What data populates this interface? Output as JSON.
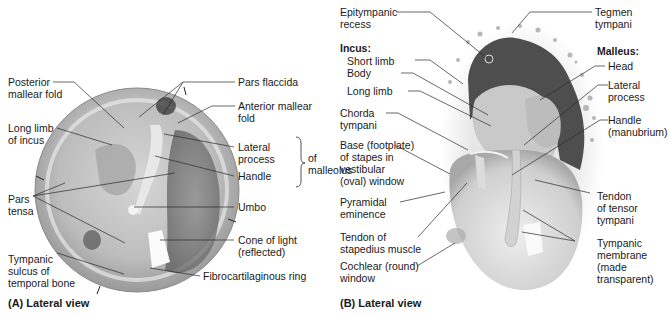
{
  "panel_a": {
    "caption": "(A) Lateral view",
    "labels": {
      "posterior_mallear_fold": [
        "Posterior",
        "mallear fold"
      ],
      "long_limb_incus": [
        "Long limb",
        "of incus"
      ],
      "pars_tensa": [
        "Pars",
        "tensa"
      ],
      "tympanic_sulcus": [
        "Tympanic",
        "sulcus of",
        "temporal bone"
      ],
      "pars_flaccida": "Pars flaccida",
      "anterior_mallear_fold": [
        "Anterior mallear",
        "fold"
      ],
      "lateral_process": [
        "Lateral",
        "process"
      ],
      "handle": "Handle",
      "of_malleolus": [
        "of",
        "malleolus"
      ],
      "umbo": "Umbo",
      "cone_of_light": [
        "Cone of light",
        "(reflected)"
      ],
      "fibrocartilaginous_ring": "Fibrocartilaginous ring"
    }
  },
  "panel_b": {
    "caption": "(B) Lateral view",
    "labels": {
      "epitympanic_recess": [
        "Epitympanic",
        "recess"
      ],
      "incus_heading": "Incus:",
      "short_limb": "Short limb",
      "body": "Body",
      "long_limb": "Long limb",
      "chorda_tympani": [
        "Chorda",
        "tympani"
      ],
      "base_stapes": [
        "Base (footplate)",
        "of stapes in",
        "vestibular",
        "(oval) window"
      ],
      "pyramidal_eminence": [
        "Pyramidal",
        "eminence"
      ],
      "tendon_stapedius": [
        "Tendon of",
        "stapedius muscle"
      ],
      "cochlear_window": [
        "Cochlear (round)",
        "window"
      ],
      "tegmen_tympani": [
        "Tegmen",
        "tympani"
      ],
      "malleus_heading": "Malleus:",
      "head": "Head",
      "lateral_process": [
        "Lateral",
        "process"
      ],
      "handle": [
        "Handle",
        "(manubrium)"
      ],
      "tendon_tensor": [
        "Tendon",
        "of tensor",
        "tympani"
      ],
      "tympanic_membrane": [
        "Tympanic",
        "membrane",
        "(made",
        "transparent)"
      ]
    }
  },
  "colors": {
    "text": "#1a1a1a",
    "leader": "#2a2a2a",
    "membrane_light": "#e4e4e4",
    "membrane_mid": "#b8b8b8",
    "membrane_dark": "#6e6e6e",
    "recess_dark": "#4a4a4a"
  }
}
